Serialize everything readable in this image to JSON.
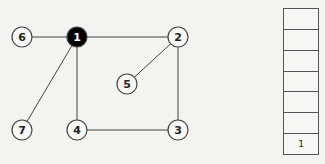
{
  "graph": {
    "nodes": [
      {
        "id": "1",
        "label": "1",
        "x": 77,
        "y": 37,
        "filled": true
      },
      {
        "id": "2",
        "label": "2",
        "x": 178,
        "y": 37,
        "filled": false
      },
      {
        "id": "3",
        "label": "3",
        "x": 178,
        "y": 130,
        "filled": false
      },
      {
        "id": "4",
        "label": "4",
        "x": 77,
        "y": 130,
        "filled": false
      },
      {
        "id": "5",
        "label": "5",
        "x": 127,
        "y": 84,
        "filled": false
      },
      {
        "id": "6",
        "label": "6",
        "x": 22,
        "y": 37,
        "filled": false
      },
      {
        "id": "7",
        "label": "7",
        "x": 22,
        "y": 130,
        "filled": false
      }
    ],
    "edges": [
      [
        "6",
        "1"
      ],
      [
        "1",
        "2"
      ],
      [
        "1",
        "4"
      ],
      [
        "1",
        "7"
      ],
      [
        "2",
        "5"
      ],
      [
        "2",
        "3"
      ],
      [
        "4",
        "3"
      ]
    ],
    "colors": {
      "stroke": "#444444",
      "fill_active": "#000000",
      "fill_node": "#f8f8f6",
      "text_active": "#ffffff",
      "text": "#222222"
    }
  },
  "stack": {
    "cells": [
      "",
      "",
      "",
      "",
      "",
      "",
      "1"
    ]
  }
}
